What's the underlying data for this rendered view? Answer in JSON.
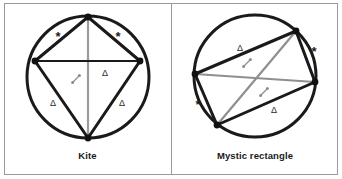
{
  "figure": {
    "background_color": "#ffffff",
    "border_color": "#9a9a9a",
    "panel_count": 2
  },
  "panels": [
    {
      "id": "kite",
      "caption": "Kite",
      "shape_name": "kite",
      "circle": {
        "cx": 84,
        "cy": 74,
        "r": 61,
        "stroke": "#1a1a1a",
        "stroke_width": 3
      },
      "vertices": [
        {
          "name": "apex-top",
          "x": 84,
          "y": 14
        },
        {
          "name": "side-right",
          "x": 136,
          "y": 58
        },
        {
          "name": "bottom",
          "x": 84,
          "y": 135
        },
        {
          "name": "side-left",
          "x": 31,
          "y": 58
        }
      ],
      "vertex_dot_color": "#111111",
      "outline_color": "#1a1a1a",
      "diagonals": [
        {
          "name": "vertical-diagonal",
          "from": "apex-top",
          "to": "bottom",
          "color": "#9b9b9b"
        },
        {
          "name": "horizontal-diagonal",
          "from": "side-left",
          "to": "side-right",
          "color": "#1a1a1a"
        }
      ],
      "marks": [
        {
          "symbol": "*",
          "name": "star-upper-left",
          "x": 54,
          "y": 33
        },
        {
          "symbol": "*",
          "name": "star-upper-right",
          "x": 114,
          "y": 33
        },
        {
          "symbol": "Δ",
          "name": "triangle-mid-right",
          "x": 101,
          "y": 70
        },
        {
          "symbol": "Δ",
          "name": "triangle-lower-left",
          "x": 49,
          "y": 100
        },
        {
          "symbol": "Δ",
          "name": "triangle-lower-right",
          "x": 118,
          "y": 100
        }
      ],
      "angle_mark": {
        "name": "right-angle-at-intersection",
        "x": 72,
        "y": 76,
        "color": "#8c8c8c"
      }
    },
    {
      "id": "mystic-rectangle",
      "caption": "Mystic rectangle",
      "shape_name": "mystic rectangle",
      "circle": {
        "cx": 83,
        "cy": 73,
        "r": 61,
        "stroke": "#1a1a1a",
        "stroke_width": 3
      },
      "vertices": [
        {
          "name": "vertex-top-right",
          "x": 124,
          "y": 28
        },
        {
          "name": "vertex-right",
          "x": 143,
          "y": 79
        },
        {
          "name": "vertex-bottom-left",
          "x": 45,
          "y": 122
        },
        {
          "name": "vertex-left",
          "x": 23,
          "y": 71
        }
      ],
      "vertex_dot_color": "#111111",
      "outline_color": "#1a1a1a",
      "diagonals": [
        {
          "name": "diagonal-a",
          "from": "vertex-top-right",
          "to": "vertex-bottom-left",
          "color": "#8f8f8f"
        },
        {
          "name": "diagonal-b",
          "from": "vertex-left",
          "to": "vertex-right",
          "color": "#8f8f8f"
        }
      ],
      "marks": [
        {
          "symbol": "Δ",
          "name": "triangle-upper-left",
          "x": 68,
          "y": 45
        },
        {
          "symbol": "Δ",
          "name": "triangle-lower-right",
          "x": 102,
          "y": 107
        },
        {
          "symbol": "*",
          "name": "star-upper-right",
          "x": 142,
          "y": 48
        },
        {
          "symbol": "*",
          "name": "star-lower-left",
          "x": 26,
          "y": 101
        }
      ],
      "angle_marks": [
        {
          "name": "angle-mark-upper",
          "x": 75,
          "y": 60,
          "color": "#8c8c8c"
        },
        {
          "name": "angle-mark-lower",
          "x": 92,
          "y": 89,
          "color": "#8c8c8c"
        }
      ]
    }
  ]
}
